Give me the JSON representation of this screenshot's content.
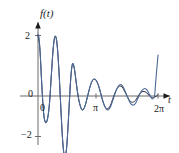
{
  "chart_data": {
    "type": "line",
    "title": "",
    "subtitle": "",
    "xlabel": "t",
    "ylabel": "f(t)",
    "xlim": [
      -0.35,
      6.95
    ],
    "ylim": [
      -2.65,
      2.65
    ],
    "grid": false,
    "legend": null,
    "x_ticks": [
      {
        "value": 0,
        "label": "0"
      },
      {
        "value": 3.14159,
        "label": "π"
      },
      {
        "value": 6.28319,
        "label": "2π"
      }
    ],
    "y_ticks": [
      {
        "value": 2,
        "label": "2"
      },
      {
        "value": 0,
        "label": "0"
      },
      {
        "value": -2,
        "label": "−2"
      }
    ],
    "axis_color": "#6b6b6b",
    "curve_color": "#4a6a96",
    "series": [
      {
        "name": "partial-sum",
        "color": "#4a6a96",
        "x": [
          0.0,
          0.05,
          0.1,
          0.15,
          0.2,
          0.25,
          0.3,
          0.35,
          0.4,
          0.45,
          0.5,
          0.55,
          0.6,
          0.65,
          0.7,
          0.75,
          0.8,
          0.85,
          0.9,
          0.95,
          1.0,
          1.05,
          1.1,
          1.15,
          1.2,
          1.25,
          1.3,
          1.35,
          1.4,
          1.45,
          1.5,
          1.55,
          1.6,
          1.65,
          1.7,
          1.75,
          1.8,
          1.85,
          1.9,
          1.95,
          2.0,
          2.1,
          2.2,
          2.3,
          2.4,
          2.5,
          2.6,
          2.7,
          2.8,
          2.9,
          3.0,
          3.1,
          3.2,
          3.3,
          3.4,
          3.5,
          3.6,
          3.7,
          3.8,
          3.9,
          4.0,
          4.1,
          4.2,
          4.3,
          4.4,
          4.5,
          4.6,
          4.7,
          4.8,
          4.9,
          5.0,
          5.1,
          5.2,
          5.3,
          5.4,
          5.5,
          5.6,
          5.7,
          5.8,
          5.9,
          6.0,
          6.1,
          6.15,
          6.2,
          6.25,
          6.283
        ],
        "y": [
          2.05,
          1.95,
          1.55,
          1.0,
          0.35,
          -0.2,
          -0.6,
          -0.8,
          -0.88,
          -0.85,
          -0.75,
          -0.55,
          -0.25,
          0.2,
          0.7,
          1.2,
          1.6,
          1.88,
          1.98,
          1.92,
          1.7,
          1.3,
          0.8,
          0.2,
          -0.45,
          -1.05,
          -1.55,
          -1.88,
          -2.02,
          -1.95,
          -1.7,
          -1.25,
          -0.7,
          -0.1,
          0.45,
          0.85,
          1.05,
          1.05,
          0.92,
          0.7,
          0.45,
          0.0,
          -0.3,
          -0.45,
          -0.42,
          -0.25,
          0.0,
          0.25,
          0.45,
          0.55,
          0.55,
          0.45,
          0.28,
          0.05,
          -0.18,
          -0.35,
          -0.45,
          -0.45,
          -0.35,
          -0.18,
          0.02,
          0.2,
          0.32,
          0.38,
          0.35,
          0.25,
          0.1,
          -0.05,
          -0.2,
          -0.28,
          -0.3,
          -0.25,
          -0.12,
          0.02,
          0.15,
          0.22,
          0.25,
          0.2,
          0.1,
          -0.02,
          -0.1,
          0.0,
          0.35,
          0.75,
          1.1,
          1.35
        ]
      },
      {
        "name": "target-function",
        "color": "#2a2a3a",
        "x": [
          0.0,
          0.1,
          0.2,
          0.3,
          0.4,
          0.5,
          0.6,
          0.7,
          0.8,
          0.9,
          1.0,
          1.1,
          1.2,
          1.3,
          1.4,
          1.5,
          1.6,
          1.7,
          1.8,
          1.9,
          2.0,
          2.1,
          2.2,
          2.3,
          2.4,
          2.5,
          2.6,
          2.7,
          2.8,
          2.9,
          3.0,
          3.1,
          3.2,
          3.3,
          3.4,
          3.5,
          3.6,
          3.7,
          3.8,
          3.9,
          4.0,
          4.1,
          4.2,
          4.3,
          4.4,
          4.5,
          4.6,
          4.7,
          4.8,
          4.9,
          5.0,
          5.1,
          5.2,
          5.3,
          5.4,
          5.5,
          5.6,
          5.7,
          5.8,
          5.9,
          6.0,
          6.1,
          6.2,
          6.283
        ],
        "y": [
          2.0,
          1.55,
          0.35,
          -0.6,
          -0.88,
          -0.75,
          -0.25,
          0.7,
          1.6,
          1.98,
          1.7,
          0.8,
          -0.45,
          -1.55,
          -2.02,
          -1.7,
          -0.7,
          0.45,
          1.05,
          0.92,
          0.45,
          0.0,
          -0.3,
          -0.45,
          -0.42,
          -0.25,
          0.0,
          0.25,
          0.45,
          0.55,
          0.55,
          0.45,
          0.28,
          0.05,
          -0.18,
          -0.35,
          -0.42,
          -0.4,
          -0.3,
          -0.12,
          0.05,
          0.2,
          0.3,
          0.33,
          0.3,
          0.2,
          0.08,
          -0.05,
          -0.15,
          -0.2,
          -0.2,
          -0.15,
          -0.05,
          0.05,
          0.12,
          0.15,
          0.14,
          0.1,
          0.03,
          -0.03,
          -0.06,
          -0.04,
          0.0,
          0.05
        ]
      }
    ],
    "annotations": [
      {
        "name": "spike-at-2pi",
        "text": "",
        "x": 6.283,
        "y": 1.35
      }
    ]
  }
}
